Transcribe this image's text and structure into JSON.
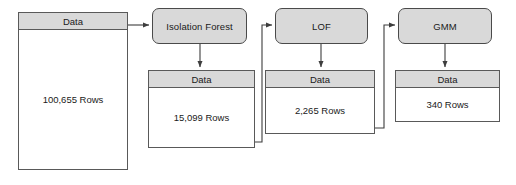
{
  "diagram": {
    "colors": {
      "node_fill": "#d9d9d9",
      "node_border": "#4a4a4a",
      "table_border": "#595959",
      "connector": "#3d3d3d",
      "background": "#ffffff",
      "text": "#1a1a1a"
    },
    "stages": [
      {
        "id": "input",
        "type": "data-table",
        "header": "Data",
        "value": "100,655 Rows"
      },
      {
        "id": "isolation-forest",
        "type": "process",
        "label": "Isolation Forest",
        "output": {
          "header": "Data",
          "value": "15,099 Rows"
        }
      },
      {
        "id": "lof",
        "type": "process",
        "label": "LOF",
        "output": {
          "header": "Data",
          "value": "2,265 Rows"
        }
      },
      {
        "id": "gmm",
        "type": "process",
        "label": "GMM",
        "output": {
          "header": "Data",
          "value": "340 Rows"
        }
      }
    ]
  }
}
